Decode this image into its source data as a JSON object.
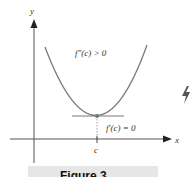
{
  "figure": {
    "axes": {
      "x_label": "x",
      "y_label": "y"
    },
    "annotations": {
      "second_derivative": "f″(c) > 0",
      "first_derivative": "f′(c) = 0",
      "point_label": "c"
    },
    "caption": "Figure 3.",
    "colors": {
      "curve": "#7a7a7a",
      "axes": "#444444",
      "point": "#777777",
      "caption_bg": "#e6e6e6"
    }
  }
}
